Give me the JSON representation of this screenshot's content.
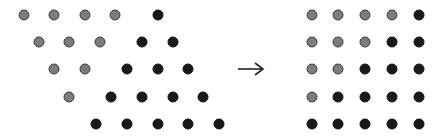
{
  "diagram": {
    "colors": {
      "gray_fill": "#7c7c7c",
      "gray_rim": "#3c3c3c",
      "black": "#1a1a1a"
    },
    "left_pattern": {
      "rows": [
        {
          "y": 15,
          "dots": [
            {
              "x": 24,
              "c": "gray"
            },
            {
              "x": 54,
              "c": "gray"
            },
            {
              "x": 85,
              "c": "gray"
            },
            {
              "x": 115,
              "c": "gray"
            },
            {
              "x": 158,
              "c": "black"
            }
          ]
        },
        {
          "y": 42,
          "dots": [
            {
              "x": 39,
              "c": "gray"
            },
            {
              "x": 69,
              "c": "gray"
            },
            {
              "x": 100,
              "c": "gray"
            },
            {
              "x": 142,
              "c": "black"
            },
            {
              "x": 173,
              "c": "black"
            }
          ]
        },
        {
          "y": 69,
          "dots": [
            {
              "x": 54,
              "c": "gray"
            },
            {
              "x": 85,
              "c": "gray"
            },
            {
              "x": 127,
              "c": "black"
            },
            {
              "x": 158,
              "c": "black"
            },
            {
              "x": 188,
              "c": "black"
            }
          ]
        },
        {
          "y": 97,
          "dots": [
            {
              "x": 69,
              "c": "gray"
            },
            {
              "x": 111,
              "c": "black"
            },
            {
              "x": 142,
              "c": "black"
            },
            {
              "x": 173,
              "c": "black"
            },
            {
              "x": 203,
              "c": "black"
            }
          ]
        },
        {
          "y": 124,
          "dots": [
            {
              "x": 96,
              "c": "black"
            },
            {
              "x": 127,
              "c": "black"
            },
            {
              "x": 158,
              "c": "black"
            },
            {
              "x": 188,
              "c": "black"
            },
            {
              "x": 219,
              "c": "black"
            }
          ]
        }
      ]
    },
    "arrow": {
      "glyph": "→",
      "direction": "right"
    },
    "right_pattern": {
      "columns_x": [
        312,
        338,
        365,
        392,
        419
      ],
      "rows_y": [
        15,
        42,
        69,
        97,
        124
      ],
      "grid": [
        [
          "gray",
          "gray",
          "gray",
          "gray",
          "black"
        ],
        [
          "gray",
          "gray",
          "gray",
          "black",
          "black"
        ],
        [
          "gray",
          "gray",
          "black",
          "black",
          "black"
        ],
        [
          "gray",
          "black",
          "black",
          "black",
          "black"
        ],
        [
          "black",
          "black",
          "black",
          "black",
          "black"
        ]
      ]
    }
  }
}
